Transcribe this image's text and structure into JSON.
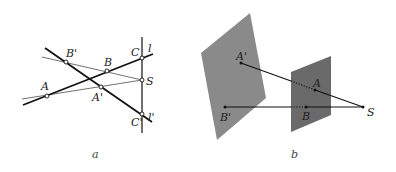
{
  "figure_a": {
    "caption": "a",
    "labels": {
      "A": "A",
      "B": "B",
      "C": "C",
      "A_prime": "A'",
      "B_prime": "B'",
      "C_prime": "C'",
      "S": "S",
      "l": "l",
      "l_prime": "l'"
    },
    "points": {
      "A": [
        47,
        96
      ],
      "B": [
        107,
        71
      ],
      "C": [
        142,
        58
      ],
      "A_prime": [
        101,
        87
      ],
      "B_prime": [
        66,
        62
      ],
      "C_prime": [
        142,
        114
      ],
      "S": [
        142,
        80
      ]
    }
  },
  "figure_b": {
    "caption": "b",
    "labels": {
      "A": "A",
      "B": "B",
      "A_prime": "A'",
      "B_prime": "B'",
      "S": "S"
    },
    "points": {
      "A": [
        315,
        90
      ],
      "B": [
        306,
        107
      ],
      "A_prime": [
        241,
        63
      ],
      "B_prime": [
        225,
        107
      ],
      "S": [
        363,
        107
      ]
    },
    "colors": {
      "large_plane": "#8a8a8a",
      "small_plane": "#6a6a6a"
    }
  }
}
